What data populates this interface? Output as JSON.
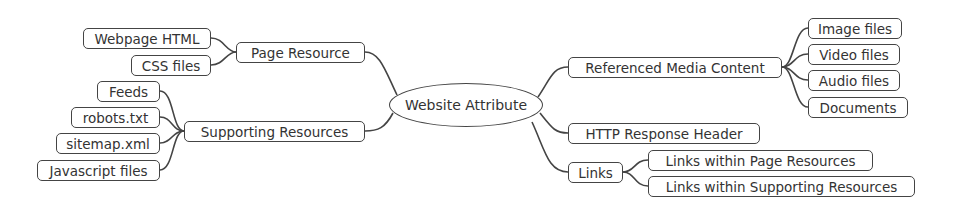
{
  "diagram": {
    "type": "mind-map",
    "root": "Website Attribute",
    "left_branches": [
      {
        "label": "Page Resource",
        "children": [
          "Webpage HTML",
          "CSS files"
        ]
      },
      {
        "label": "Supporting Resources",
        "children": [
          "Feeds",
          "robots.txt",
          "sitemap.xml",
          "Javascript files"
        ]
      }
    ],
    "right_branches": [
      {
        "label": "Referenced Media Content",
        "children": [
          "Image files",
          "Video files",
          "Audio files",
          "Documents"
        ]
      },
      {
        "label": "HTTP Response Header",
        "children": []
      },
      {
        "label": "Links",
        "children": [
          "Links within Page Resources",
          "Links within Supporting Resources"
        ]
      }
    ],
    "colors": {
      "stroke": "#444444",
      "text": "#333333",
      "background": "#ffffff"
    }
  }
}
